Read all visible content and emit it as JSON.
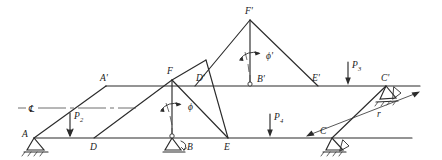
{
  "figure": {
    "type": "structural-statics-diagram",
    "background_color": "#ffffff",
    "line_color": "#2b2b2b"
  },
  "joint_labels": {
    "a": "A",
    "d": "D",
    "b": "B",
    "e": "E",
    "c": "C",
    "f": "F",
    "a_prime": "A'",
    "d_prime": "D'",
    "b_prime": "B'",
    "e_prime": "E'",
    "c_prime": "C'",
    "f_prime": "F'"
  },
  "loads": {
    "p2": "P",
    "p2_sub": "2",
    "p3": "P",
    "p3_sub": "3",
    "p4": "P",
    "p4_sub": "4"
  },
  "angles": {
    "phi": "ϕ",
    "phi_prime": "ϕ'"
  },
  "dimensions": {
    "r": "r"
  },
  "annotations": {
    "centerline_symbol": "℄"
  },
  "supports": {
    "a_type": "pin-support",
    "b_type": "pin-support-rotated",
    "c_type": "pin-support",
    "c_prime_type": "pin-support-inclined",
    "b_prime_type": "pin-node"
  }
}
